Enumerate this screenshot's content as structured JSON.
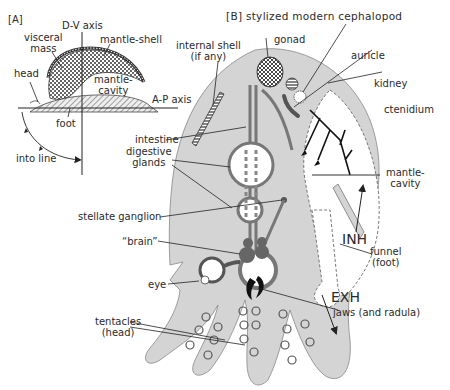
{
  "panel_a": {
    "tag": "[A]",
    "dv_axis": "D-V axis",
    "ap_axis": "A-P axis",
    "visceral_mass": [
      "visceral",
      "mass"
    ],
    "mantle_shell": "mantle-shell",
    "head": "head",
    "mantle_cavity": [
      "mantle-",
      "cavity"
    ],
    "foot": "foot",
    "into_line": "into line"
  },
  "panel_b": {
    "title": "[B] stylized modern cephalopod",
    "internal_shell": [
      "internal shell",
      "(if any)"
    ],
    "gonad": "gonad",
    "auricle": "auricle",
    "kidney": "kidney",
    "ctenidium": "ctenidium",
    "intestine": "intestine",
    "digestive_glands": [
      "digestive",
      "glands"
    ],
    "mantle_cavity": [
      "mantle-",
      "cavity"
    ],
    "stellate_ganglion": "stellate ganglion",
    "inh": "INH",
    "brain": "“brain”",
    "funnel": [
      "funnel",
      "(foot)"
    ],
    "eye": "eye",
    "exh": "EXH",
    "jaws": "jaws (and radula)",
    "tentacles": [
      "tentacles",
      "(head)"
    ]
  },
  "colors": {
    "body_fill": "#d4d4d4",
    "organ_fill": "#6e6e6e",
    "line": "#2a2a2a"
  }
}
